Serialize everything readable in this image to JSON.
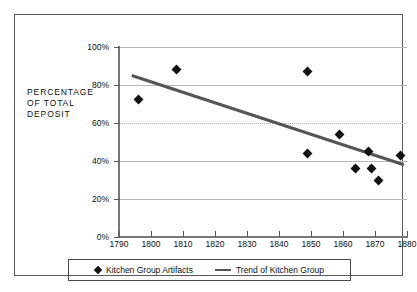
{
  "chart_data": {
    "type": "scatter",
    "title": "",
    "xlabel": "",
    "ylabel": "PERCENTAGE OF TOTAL DEPOSIT",
    "ylabel_lines": [
      "PERCENTAGE",
      "OF TOTAL",
      "DEPOSIT"
    ],
    "xlim": [
      1790,
      1880
    ],
    "ylim": [
      0,
      100
    ],
    "grid": true,
    "legend_position": "bottom",
    "x_tick_labels": [
      "1790",
      "1800",
      "1810",
      "1820",
      "1830",
      "1840",
      "1850",
      "1860",
      "1870",
      "1880"
    ],
    "x_ticks": [
      1790,
      1800,
      1810,
      1820,
      1830,
      1840,
      1850,
      1860,
      1870,
      1880
    ],
    "y_tick_labels": [
      "0%",
      "20%",
      "40%",
      "60%",
      "80%",
      "100%"
    ],
    "y_ticks": [
      0,
      20,
      40,
      60,
      80,
      100
    ],
    "series": [
      {
        "name": "Kitchen Group Artifacts",
        "type": "scatter",
        "marker": "diamond",
        "color": "#111111",
        "points": [
          {
            "x": 1796,
            "y": 72.5
          },
          {
            "x": 1808,
            "y": 88
          },
          {
            "x": 1849,
            "y": 87
          },
          {
            "x": 1849,
            "y": 44
          },
          {
            "x": 1859,
            "y": 54
          },
          {
            "x": 1864,
            "y": 36
          },
          {
            "x": 1868,
            "y": 45
          },
          {
            "x": 1869,
            "y": 36
          },
          {
            "x": 1871,
            "y": 30
          },
          {
            "x": 1878,
            "y": 43
          }
        ]
      },
      {
        "name": "Trend of Kitchen Group",
        "type": "line",
        "color": "#555555",
        "points": [
          {
            "x": 1794,
            "y": 85
          },
          {
            "x": 1879,
            "y": 38
          }
        ]
      }
    ]
  },
  "legend": {
    "items": [
      {
        "label": "Kitchen Group Artifacts",
        "marker": "diamond"
      },
      {
        "label": "Trend of Kitchen Group",
        "marker": "line"
      }
    ]
  },
  "axis": {
    "y_title_line1": "PERCENTAGE",
    "y_title_line2": "OF TOTAL",
    "y_title_line3": "DEPOSIT"
  },
  "colors": {
    "marker": "#111111",
    "trend": "#555555",
    "grid": "#b8b8b8",
    "axis": "#777777",
    "frame": "#5a5a5a"
  }
}
